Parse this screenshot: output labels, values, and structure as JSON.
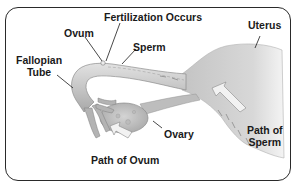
{
  "diagram": {
    "labels": {
      "fertilization": "Fertilization Occurs",
      "ovum": "Ovum",
      "sperm": "Sperm",
      "uterus": "Uterus",
      "fallopian_tube_line1": "Fallopian",
      "fallopian_tube_line2": "Tube",
      "ovary": "Ovary",
      "path_of_ovum": "Path of Ovum",
      "path_of_sperm_line1": "Path of",
      "path_of_sperm_line2": "Sperm"
    },
    "colors": {
      "tissue": "#c8c8c8",
      "tissue_dark": "#9a9a9a",
      "tissue_light": "#e6e6e6",
      "border": "#2a2a2a",
      "text": "#1a1a1a"
    }
  }
}
